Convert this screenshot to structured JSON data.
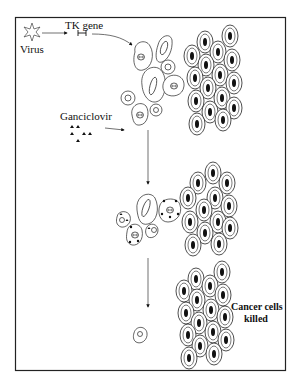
{
  "labels": {
    "virus": "Virus",
    "tk_gene": "TK gene",
    "ganciclovir": "Ganciclovir",
    "cancer_cells_killed_line1": "Cancer cells",
    "cancer_cells_killed_line2": "killed"
  },
  "colors": {
    "ink": "#111111",
    "background": "#ffffff",
    "border": "#222222"
  },
  "stages": [
    {
      "name": "transduction",
      "description": "Virus delivers TK gene into some tumor cells"
    },
    {
      "name": "drug-exposure",
      "description": "Ganciclovir added; TK-expressing cells take up drug"
    },
    {
      "name": "outcome",
      "description": "Cancer cells killed"
    }
  ]
}
